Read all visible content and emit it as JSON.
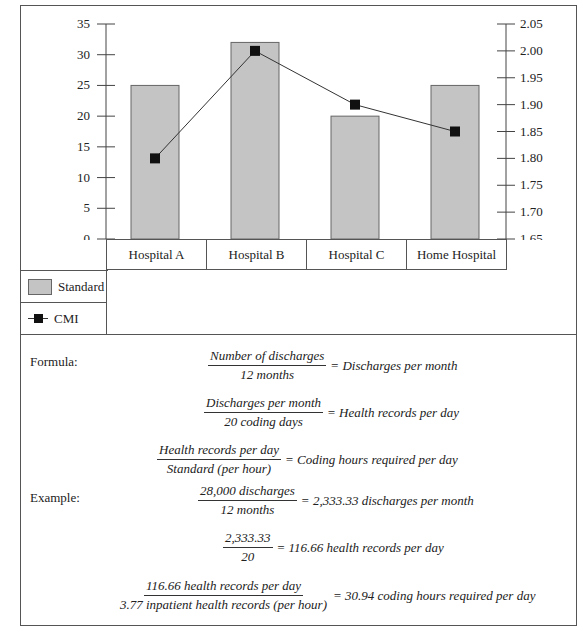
{
  "chart_data": {
    "type": "bar",
    "categories": [
      "Hospital A",
      "Hospital B",
      "Hospital C",
      "Home Hospital"
    ],
    "series": [
      {
        "name": "Standard",
        "type": "bar",
        "axis": "left",
        "values": [
          25,
          32,
          20,
          25
        ]
      },
      {
        "name": "CMI",
        "type": "line",
        "axis": "right",
        "values": [
          1.8,
          2.0,
          1.9,
          1.85
        ]
      }
    ],
    "left_axis": {
      "ylim": [
        0,
        35
      ],
      "ticks": [
        "0",
        "5",
        "10",
        "15",
        "20",
        "25",
        "30",
        "35"
      ]
    },
    "right_axis": {
      "ylim": [
        1.65,
        2.05
      ],
      "ticks": [
        "1.65",
        "1.70",
        "1.75",
        "1.80",
        "1.85",
        "1.90",
        "1.95",
        "2.00",
        "2.05"
      ]
    },
    "legend": [
      "Standard",
      "CMI"
    ],
    "legend_position": "bottom-left",
    "grid": false
  },
  "legend": {
    "standard": "Standard",
    "cmi": "CMI"
  },
  "formula": {
    "label": "Formula:",
    "lines": [
      {
        "num": "Number of discharges",
        "den": "12 months",
        "result": "= Discharges per month"
      },
      {
        "num": "Discharges per month",
        "den": "20 coding days",
        "result": "= Health records per day"
      },
      {
        "num": "Health records per day",
        "den": "Standard (per hour)",
        "result": "= Coding hours required per day"
      }
    ]
  },
  "example": {
    "label": "Example:",
    "lines": [
      {
        "num": "28,000 discharges",
        "den": "12 months",
        "result": "= 2,333.33 discharges per month"
      },
      {
        "num": "2,333.33",
        "den": "20",
        "result": "= 116.66 health records per day"
      },
      {
        "num": "116.66 health records per day",
        "den": "3.77 inpatient health records (per hour)",
        "result": "= 30.94 coding hours required per day"
      }
    ]
  },
  "colors": {
    "bar": "#c4c4c4",
    "bar_border": "#666666",
    "line": "#333333",
    "marker": "#111111"
  }
}
